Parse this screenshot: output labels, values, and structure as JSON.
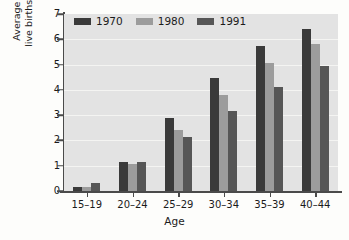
{
  "chart_data": {
    "type": "bar",
    "title": "",
    "xlabel": "Age",
    "ylabel_line1": "Average number of",
    "ylabel_line2": "live births per woman",
    "categories": [
      "15–19",
      "20–24",
      "25–29",
      "30–34",
      "35–39",
      "40–44"
    ],
    "series": [
      {
        "name": "1970",
        "color": "#3a3a3a",
        "values": [
          0.15,
          1.15,
          2.9,
          4.45,
          5.75,
          6.4
        ]
      },
      {
        "name": "1980",
        "color": "#9c9c9c",
        "values": [
          0.17,
          1.05,
          2.4,
          3.8,
          5.05,
          5.8
        ]
      },
      {
        "name": "1991",
        "color": "#565656",
        "values": [
          0.3,
          1.15,
          2.15,
          3.15,
          4.1,
          4.95
        ]
      }
    ],
    "ylim": [
      0,
      7
    ],
    "yticks": [
      0,
      1,
      2,
      3,
      4,
      5,
      6,
      7
    ],
    "ytick_labels": [
      "0",
      "1",
      "2",
      "3",
      "4",
      "5",
      "6",
      "7"
    ],
    "grid": "horizontal",
    "legend_position": "top-left-inside",
    "plot_background": "#e3e3e3",
    "figure_background": "#fdfdfb",
    "axis_color": "#4a4a4a",
    "gridline_color": "#f4f4f2"
  }
}
